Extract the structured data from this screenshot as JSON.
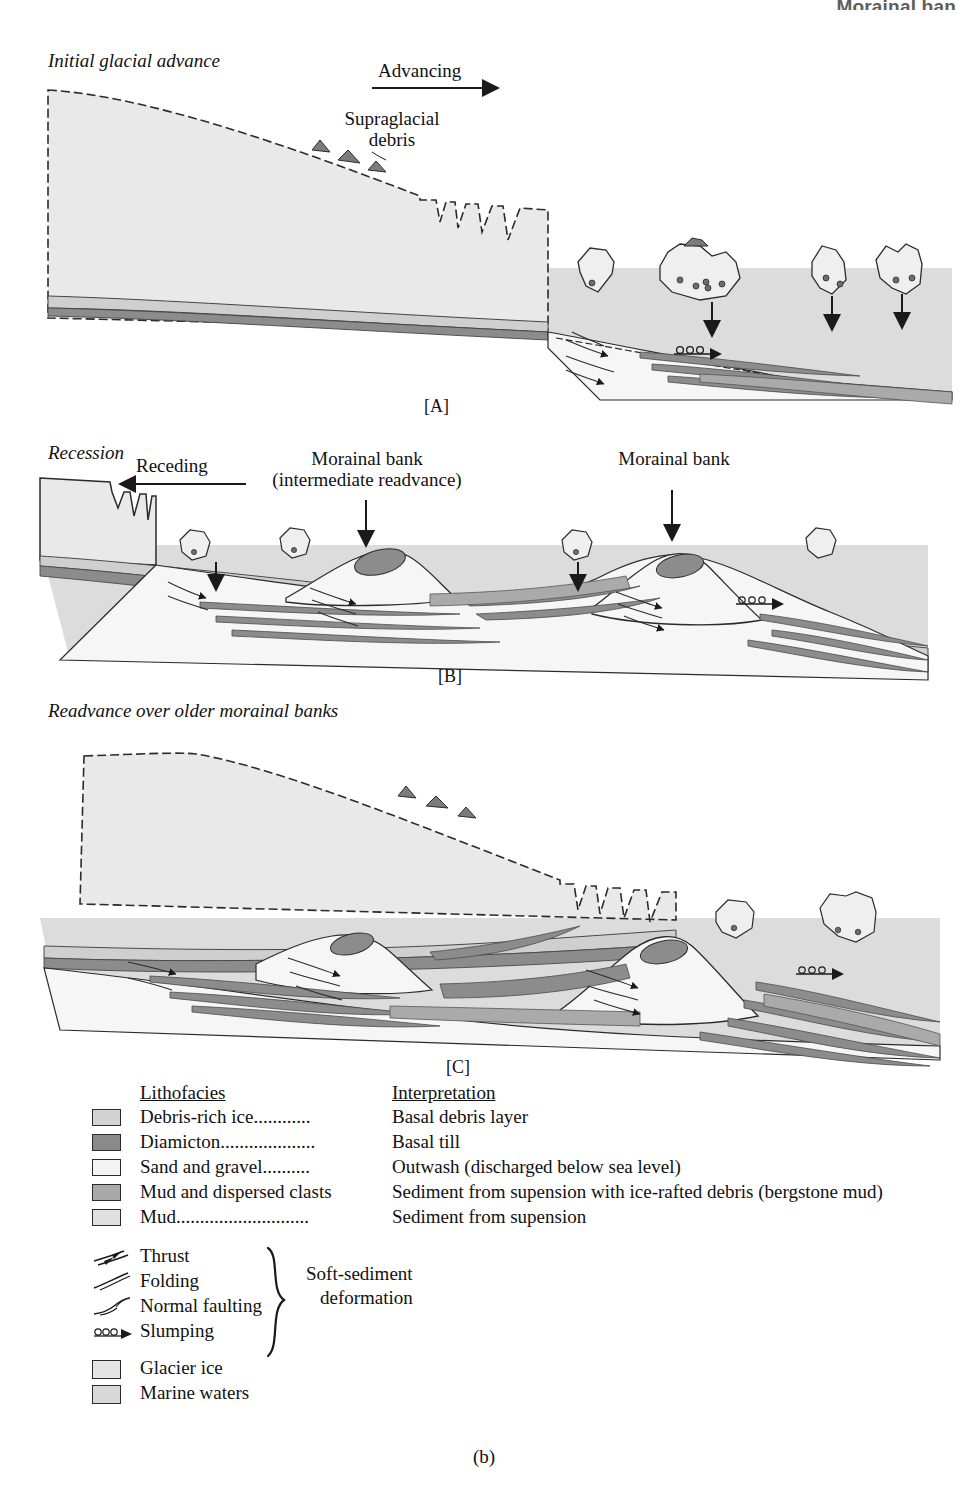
{
  "running_header": "Morainal ban",
  "figure": {
    "subfigure_label": "(b)"
  },
  "panels": [
    {
      "id": "A",
      "letter": "[A]",
      "title": "Initial glacial advance",
      "direction_label": "Advancing",
      "direction": "right",
      "callouts": [
        {
          "name": "supraglacial-debris",
          "line1": "Supraglacial",
          "line2": "debris"
        },
        {
          "name": "rain-out",
          "line1": "Rain-out",
          "line2": ""
        },
        {
          "name": "slumping",
          "line1": "Slumping",
          "line2": ""
        }
      ]
    },
    {
      "id": "B",
      "letter": "[B]",
      "title": "Recession",
      "direction_label": "Receding",
      "direction": "left",
      "callouts": [
        {
          "name": "morainal-bank-intermediate",
          "line1": "Morainal bank",
          "line2": "(intermediate readvance)"
        },
        {
          "name": "morainal-bank",
          "line1": "Morainal bank",
          "line2": ""
        }
      ]
    },
    {
      "id": "C",
      "letter": "[C]",
      "title": "Readvance over older morainal banks",
      "direction_label": "",
      "direction": "",
      "callouts": []
    }
  ],
  "legend": {
    "lithofacies_header": "Lithofacies",
    "interpretation_header": "Interpretation",
    "rows": [
      {
        "name": "debris-rich-ice",
        "lithofacies": "Debris-rich ice............",
        "interpretation": "Basal debris layer",
        "color": "#d2d2d2"
      },
      {
        "name": "diamicton",
        "lithofacies": "Diamicton....................",
        "interpretation": "Basal till",
        "color": "#8a8a8a"
      },
      {
        "name": "sand-and-gravel",
        "lithofacies": "Sand and gravel..........",
        "interpretation": "Outwash (discharged below sea level)",
        "color": "#f4f4f4"
      },
      {
        "name": "mud-and-dispersed-clasts",
        "lithofacies": "Mud and dispersed clasts",
        "interpretation": "Sediment from supension with ice-rafted debris (bergstone mud)",
        "color": "#a9a9a9"
      },
      {
        "name": "mud",
        "lithofacies": "Mud............................",
        "interpretation": "Sediment from supension",
        "color": "#e0e0e0"
      }
    ],
    "symbols": [
      {
        "name": "thrust",
        "label": "Thrust"
      },
      {
        "name": "folding",
        "label": "Folding"
      },
      {
        "name": "normal-faulting",
        "label": "Normal faulting"
      },
      {
        "name": "slumping",
        "label": "Slumping"
      }
    ],
    "brace_label_line1": "Soft-sediment",
    "brace_label_line2": "deformation",
    "materials": [
      {
        "name": "glacier-ice",
        "label": "Glacier ice",
        "color": "#e4e4e4"
      },
      {
        "name": "marine-waters",
        "label": "Marine waters",
        "color": "#d8d8d8"
      }
    ]
  },
  "colors": {
    "glacier_ice": "#e9e9e9",
    "marine_water": "#dcdcdc",
    "debris_rich_ice": "#cfcfcf",
    "diamicton": "#8c8c8c",
    "sand_gravel": "#f6f6f6",
    "mud_clasts": "#aaaaaa",
    "mud": "#e2e2e2",
    "outline": "#2b2b2b"
  },
  "faint_background_text": {
    "line1": "of the series when it be back last its grip",
    "line2": "unrelated..a new chapter section. Edit the first Sequences",
    "line3": "before it a from and of old distinct fact of what"
  }
}
